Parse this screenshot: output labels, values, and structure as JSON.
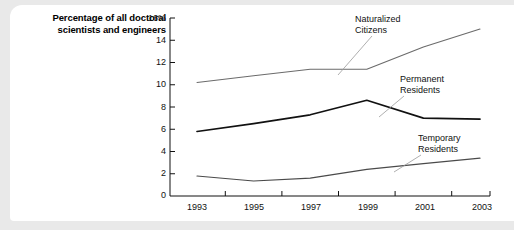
{
  "chart_data": {
    "type": "line",
    "title": "Percentage of all doctoral scientists and engineers",
    "xlabel": "",
    "ylabel": "Percentage of all doctoral scientists and engineers",
    "x": [
      1993,
      1995,
      1997,
      1999,
      2001,
      2003
    ],
    "xtick_labels": [
      "1993",
      "1995",
      "1997",
      "1999",
      "2001",
      "2003"
    ],
    "ytick_labels": [
      "16%",
      "14",
      "12",
      "10",
      "8",
      "6",
      "4",
      "2",
      "0"
    ],
    "yticks": [
      16,
      14,
      12,
      10,
      8,
      6,
      4,
      2,
      0
    ],
    "ylim": [
      0,
      16
    ],
    "xlim": [
      1993,
      2003
    ],
    "grid": false,
    "legend_position": "inline-annotations",
    "series": [
      {
        "name": "Naturalized Citizens",
        "label": "Naturalized\nCitizens",
        "label_line1": "Naturalized",
        "label_line2": "Citizens",
        "values": [
          10.2,
          10.8,
          11.4,
          11.4,
          13.4,
          15.0
        ],
        "color": "#6b6b6b",
        "width": 1.1
      },
      {
        "name": "Permanent Residents",
        "label": "Permanent\nResidents",
        "label_line1": "Permanent",
        "label_line2": "Residents",
        "values": [
          5.8,
          6.5,
          7.3,
          8.6,
          7.0,
          6.9
        ],
        "color": "#111111",
        "width": 1.7
      },
      {
        "name": "Temporary Residents",
        "label": "Temporary\nResidents",
        "label_line1": "Temporary",
        "label_line2": "Residents",
        "values": [
          1.8,
          1.35,
          1.6,
          2.4,
          2.9,
          3.4
        ],
        "color": "#4a4a4a",
        "width": 1.2
      }
    ]
  },
  "colors": {
    "page_background": "#e9e9e9",
    "card_background": "#ffffff",
    "axis": "#111111",
    "text": "#111111",
    "leader_line": "#9a9a9a"
  }
}
